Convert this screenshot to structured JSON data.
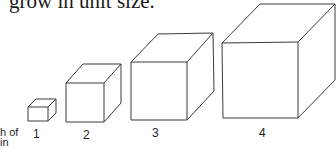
{
  "document": {
    "caption_top": "grow in unit size.",
    "axis_label_line1": "h of",
    "axis_label_line2": "in",
    "cubes": [
      {
        "label": "1",
        "icon": "cube-small-icon"
      },
      {
        "label": "2",
        "icon": "cube-medium-icon"
      },
      {
        "label": "3",
        "icon": "cube-large-icon"
      },
      {
        "label": "4",
        "icon": "cube-xlarge-icon"
      }
    ],
    "colors": {
      "line": "#3a3a3a",
      "text": "#1f1f1f",
      "background": "#ffffff"
    }
  }
}
